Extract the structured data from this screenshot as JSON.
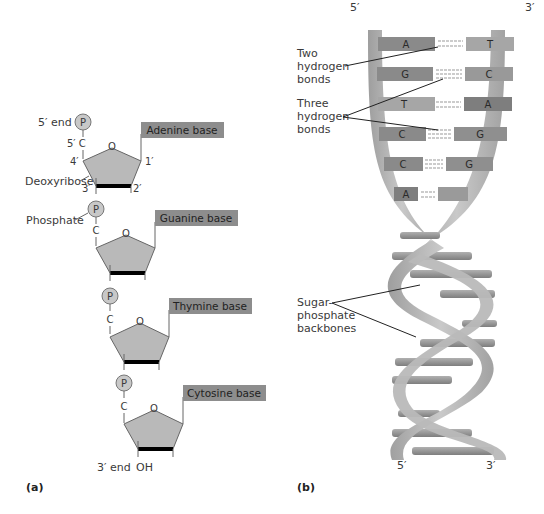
{
  "panel_a": {
    "label": "(a)",
    "five_prime_end": "5′ end",
    "three_prime_end": "3′ end",
    "oh": "OH",
    "phosphate_symbol": "P",
    "carbon_symbol": "C",
    "oxygen_symbol": "O",
    "five_prime_c": "5′ C",
    "carbon_positions": {
      "c4": "4′",
      "c1": "1′",
      "c3": "3′",
      "c2": "2′"
    },
    "deoxyribose_label": "Deoxyribose",
    "phosphate_label": "Phosphate",
    "bases": [
      {
        "label": "Adenine base"
      },
      {
        "label": "Guanine base"
      },
      {
        "label": "Thymine base"
      },
      {
        "label": "Cytosine base"
      }
    ],
    "colors": {
      "sugar": "#b9b9b9",
      "base_box": "#8d8d8d",
      "phosphate": "#c8c8c8"
    }
  },
  "panel_b": {
    "label": "(b)",
    "top_left": "5′",
    "top_right": "3′",
    "bottom_left": "5′",
    "bottom_right": "3′",
    "callouts": {
      "two_bonds": [
        "Two",
        "hydrogen",
        "bonds"
      ],
      "three_bonds": [
        "Three",
        "hydrogen",
        "bonds"
      ],
      "backbones": [
        "Sugar-",
        "phosphate",
        "backbones"
      ]
    },
    "base_pairs": [
      {
        "left": "A",
        "right": "T",
        "bonds": 2
      },
      {
        "left": "G",
        "right": "C",
        "bonds": 3
      },
      {
        "left": "T",
        "right": "A",
        "bonds": 2
      },
      {
        "left": "C",
        "right": "G",
        "bonds": 3
      },
      {
        "left": "C",
        "right": "G",
        "bonds": 3
      },
      {
        "left": "A",
        "right": "",
        "bonds": 2
      }
    ],
    "colors": {
      "backbone": "#b4b4b4",
      "base_dark": "#8a8a8a",
      "base_light": "#a6a6a6"
    }
  }
}
